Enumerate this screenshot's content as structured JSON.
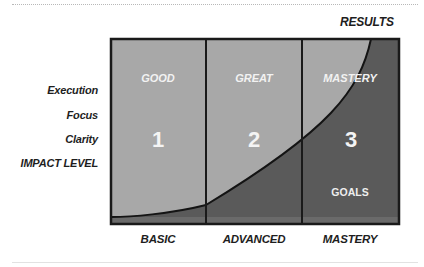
{
  "title_right": "RESULTS",
  "y_labels": [
    "Execution",
    "Focus",
    "Clarity",
    "IMPACT LEVEL"
  ],
  "x_labels": [
    "BASIC",
    "ADVANCED",
    "MASTERY"
  ],
  "cells": [
    {
      "title": "GOOD",
      "number": "1"
    },
    {
      "title": "GREAT",
      "number": "2"
    },
    {
      "title": "MASTERY",
      "number": "3"
    }
  ],
  "region_label": "GOALS",
  "colors": {
    "light_region": "#a6a6a6",
    "dark_region": "#5c5c5c",
    "border": "#1a1a1a",
    "text_light": "#f2f2f2"
  }
}
